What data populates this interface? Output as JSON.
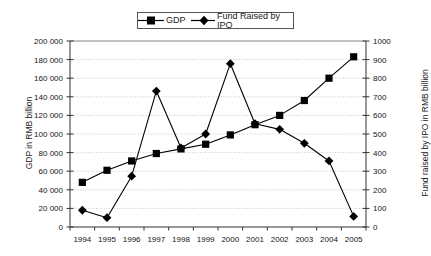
{
  "chart_data": {
    "type": "line",
    "title": "",
    "subtitle": "",
    "xlabel": "",
    "categories": [
      "1994",
      "1995",
      "1996",
      "1997",
      "1998",
      "1999",
      "2000",
      "2001",
      "2002",
      "2003",
      "2004",
      "2005"
    ],
    "x": [
      1994,
      1995,
      1996,
      1997,
      1998,
      1999,
      2000,
      2001,
      2002,
      2003,
      2004,
      2005
    ],
    "series": [
      {
        "name": "GDP",
        "axis": "left",
        "marker": "square",
        "color": "#000000",
        "values": [
          48000,
          61000,
          71000,
          79000,
          84000,
          89000,
          99000,
          110000,
          120000,
          136000,
          160000,
          183000
        ]
      },
      {
        "name": "Fund Raised by IPO",
        "axis": "right",
        "marker": "diamond",
        "color": "#000000",
        "values": [
          90,
          50,
          273,
          731,
          425,
          500,
          878,
          555,
          525,
          450,
          355,
          57
        ]
      }
    ],
    "left_axis": {
      "label": "GDP in RMB billion",
      "ylim": [
        0,
        200000
      ],
      "tick_step": 20000,
      "ticks": [
        0,
        20000,
        40000,
        60000,
        80000,
        100000,
        120000,
        140000,
        160000,
        180000,
        200000
      ],
      "tick_labels": [
        "0",
        "20 000",
        "40 000",
        "60 000",
        "80 000",
        "100 000",
        "120 000",
        "140 000",
        "160 000",
        "180 000",
        "200 000"
      ]
    },
    "right_axis": {
      "label": "Fund raised by IPO in RMB billion",
      "ylim": [
        0,
        1000
      ],
      "tick_step": 100,
      "ticks": [
        0,
        100,
        200,
        300,
        400,
        500,
        600,
        700,
        800,
        900,
        1000
      ],
      "tick_labels": [
        "0",
        "100",
        "200",
        "300",
        "400",
        "500",
        "600",
        "700",
        "800",
        "900",
        "1000"
      ]
    },
    "grid": {
      "horizontal": true,
      "vertical": false,
      "style": "dotted",
      "color": "#bcbcbc"
    },
    "legend": {
      "position": "top-center",
      "border": true,
      "entries": [
        {
          "label": "GDP",
          "marker": "square"
        },
        {
          "label": "Fund Raised by IPO",
          "marker": "diamond"
        }
      ]
    }
  },
  "legend": {
    "gdp_label": "GDP",
    "ipo_label": "Fund Raised by IPO"
  },
  "axes": {
    "left_title": "GDP in RMB billion",
    "right_title": "Fund raised by IPO in RMB billion"
  }
}
